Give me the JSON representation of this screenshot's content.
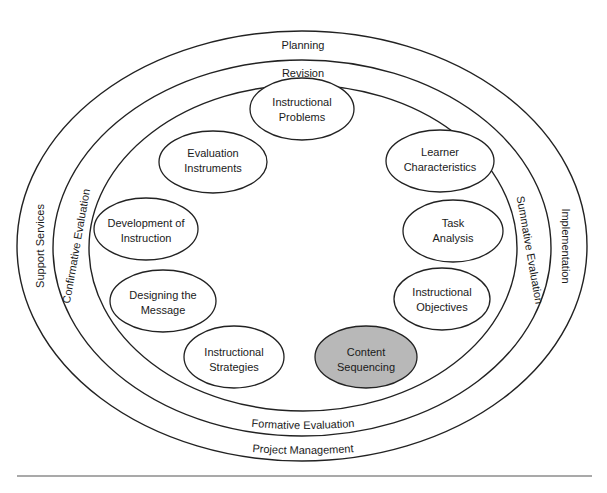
{
  "diagram": {
    "colors": {
      "stroke": "#222222",
      "node_fill": "#ffffff",
      "highlight_fill": "#b8b8b8",
      "background": "#ffffff"
    },
    "rings": {
      "outer": {
        "top": "Planning",
        "bottom": "Project Management",
        "left": "Support Services",
        "right": "Implementation"
      },
      "middle": {
        "top": "Revision",
        "bottom": "Formative Evaluation",
        "left": "Confirmative Evaluation",
        "right": "Summative Evaluation"
      }
    },
    "nodes": [
      {
        "id": "instructional-problems",
        "line1": "Instructional",
        "line2": "Problems",
        "highlighted": false
      },
      {
        "id": "learner-characteristics",
        "line1": "Learner",
        "line2": "Characteristics",
        "highlighted": false
      },
      {
        "id": "task-analysis",
        "line1": "Task",
        "line2": "Analysis",
        "highlighted": false
      },
      {
        "id": "instructional-objectives",
        "line1": "Instructional",
        "line2": "Objectives",
        "highlighted": false
      },
      {
        "id": "content-sequencing",
        "line1": "Content",
        "line2": "Sequencing",
        "highlighted": true
      },
      {
        "id": "instructional-strategies",
        "line1": "Instructional",
        "line2": "Strategies",
        "highlighted": false
      },
      {
        "id": "designing-the-message",
        "line1": "Designing the",
        "line2": "Message",
        "highlighted": false
      },
      {
        "id": "development-of-instruction",
        "line1": "Development of",
        "line2": "Instruction",
        "highlighted": false
      },
      {
        "id": "evaluation-instruments",
        "line1": "Evaluation",
        "line2": "Instruments",
        "highlighted": false
      }
    ]
  }
}
